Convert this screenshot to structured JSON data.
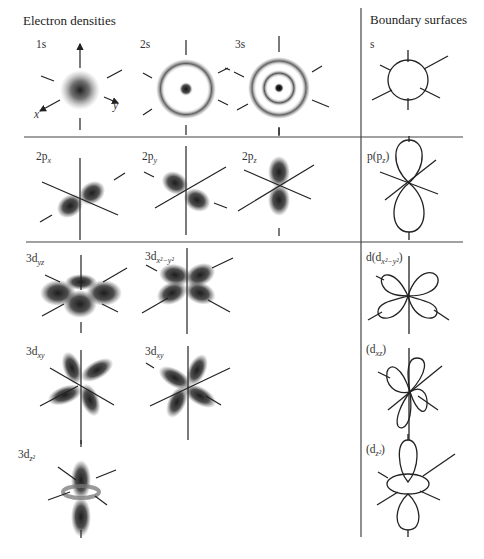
{
  "headers": {
    "electron_densities": "Electron densities",
    "boundary_surfaces": "Boundary surfaces"
  },
  "orbitals": {
    "s1": {
      "main": "1s"
    },
    "s2": {
      "main": "2s"
    },
    "s3": {
      "main": "3s"
    },
    "px": {
      "main": "2p",
      "sub": "x"
    },
    "py": {
      "main": "2p",
      "sub": "y"
    },
    "pz": {
      "main": "2p",
      "sub": "z"
    },
    "dyz": {
      "main": "3d",
      "sub": "yz"
    },
    "dx2y2": {
      "main": "3d",
      "sub": "x²−y²"
    },
    "dxy1": {
      "main": "3d",
      "sub": "xy"
    },
    "dxy2": {
      "main": "3d",
      "sub": "xy"
    },
    "dz2": {
      "main": "3d",
      "sub": "z²"
    }
  },
  "boundary": {
    "s": {
      "main": "s"
    },
    "p": {
      "main": "p(p",
      "sub": "z",
      "tail": ")"
    },
    "d1": {
      "main": "d(d",
      "sub": "x²−y²",
      "tail": ")"
    },
    "d2": {
      "main": "(d",
      "sub": "xz",
      "tail": ")"
    },
    "d3": {
      "main": "(d",
      "sub": "z²",
      "tail": ")"
    }
  },
  "axes": {
    "x": "x",
    "y": "y"
  },
  "colors": {
    "ink": "#222222",
    "line": "#333333",
    "density": "#111111"
  }
}
